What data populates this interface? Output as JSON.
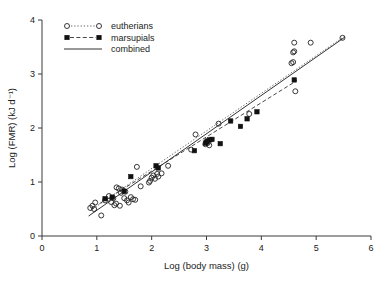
{
  "chart_data": {
    "type": "scatter",
    "title": "",
    "xlabel": "Log (body mass) (g)",
    "ylabel": "Log (FMR) (kJ d⁻¹)",
    "xlim": [
      0,
      6
    ],
    "ylim": [
      0,
      4
    ],
    "xticks": [
      0,
      1,
      2,
      3,
      4,
      5,
      6
    ],
    "yticks": [
      0,
      1,
      2,
      3,
      4
    ],
    "grid": false,
    "legend_position": "top-left",
    "legend": [
      {
        "label": "eutherians",
        "marker": "open-circle",
        "line": "dotted"
      },
      {
        "label": "marsupials",
        "marker": "filled-square",
        "line": "dashed"
      },
      {
        "label": "combined",
        "marker": "none",
        "line": "solid"
      }
    ],
    "series": [
      {
        "name": "eutherians",
        "marker": "open-circle",
        "points": [
          [
            0.88,
            0.52
          ],
          [
            0.92,
            0.56
          ],
          [
            0.95,
            0.5
          ],
          [
            0.97,
            0.62
          ],
          [
            1.08,
            0.38
          ],
          [
            1.15,
            0.66
          ],
          [
            1.22,
            0.74
          ],
          [
            1.26,
            0.63
          ],
          [
            1.3,
            0.7
          ],
          [
            1.32,
            0.57
          ],
          [
            1.35,
            0.6
          ],
          [
            1.36,
            0.9
          ],
          [
            1.4,
            0.88
          ],
          [
            1.42,
            0.56
          ],
          [
            1.44,
            0.8
          ],
          [
            1.46,
            0.86
          ],
          [
            1.5,
            0.7
          ],
          [
            1.52,
            0.82
          ],
          [
            1.55,
            0.66
          ],
          [
            1.58,
            0.62
          ],
          [
            1.62,
            0.72
          ],
          [
            1.66,
            0.68
          ],
          [
            1.7,
            0.67
          ],
          [
            1.73,
            1.28
          ],
          [
            1.8,
            0.92
          ],
          [
            1.95,
            0.99
          ],
          [
            1.97,
            1.02
          ],
          [
            2.0,
            1.08
          ],
          [
            2.03,
            1.12
          ],
          [
            2.06,
            1.06
          ],
          [
            2.1,
            1.15
          ],
          [
            2.12,
            1.1
          ],
          [
            2.18,
            1.16
          ],
          [
            2.3,
            1.3
          ],
          [
            2.72,
            1.6
          ],
          [
            2.8,
            1.88
          ],
          [
            2.98,
            1.7
          ],
          [
            3.02,
            1.72
          ],
          [
            3.05,
            1.68
          ],
          [
            3.22,
            2.08
          ],
          [
            3.78,
            2.26
          ],
          [
            4.55,
            3.2
          ],
          [
            4.58,
            3.22
          ],
          [
            4.58,
            3.4
          ],
          [
            4.6,
            3.42
          ],
          [
            4.62,
            2.68
          ],
          [
            4.6,
            3.58
          ],
          [
            4.9,
            3.58
          ],
          [
            5.48,
            3.67
          ]
        ]
      },
      {
        "name": "marsupials",
        "marker": "filled-square",
        "points": [
          [
            1.15,
            0.69
          ],
          [
            1.28,
            0.72
          ],
          [
            1.5,
            0.83
          ],
          [
            1.62,
            1.1
          ],
          [
            2.08,
            1.3
          ],
          [
            2.12,
            1.26
          ],
          [
            2.78,
            1.58
          ],
          [
            2.98,
            1.72
          ],
          [
            3.0,
            1.74
          ],
          [
            3.02,
            1.76
          ],
          [
            3.06,
            1.78
          ],
          [
            3.1,
            1.79
          ],
          [
            3.25,
            1.71
          ],
          [
            3.44,
            2.13
          ],
          [
            3.62,
            2.03
          ],
          [
            3.74,
            2.17
          ],
          [
            3.92,
            2.3
          ],
          [
            4.6,
            2.89
          ]
        ]
      }
    ],
    "fit_lines": [
      {
        "name": "combined",
        "style": "solid",
        "x": [
          0.85,
          5.52
        ],
        "y": [
          0.37,
          3.68
        ]
      },
      {
        "name": "eutherians",
        "style": "dotted",
        "x": [
          0.88,
          5.52
        ],
        "y": [
          0.47,
          3.7
        ]
      },
      {
        "name": "marsupials",
        "style": "dashed",
        "x": [
          1.05,
          4.65
        ],
        "y": [
          0.6,
          2.88
        ]
      }
    ]
  }
}
